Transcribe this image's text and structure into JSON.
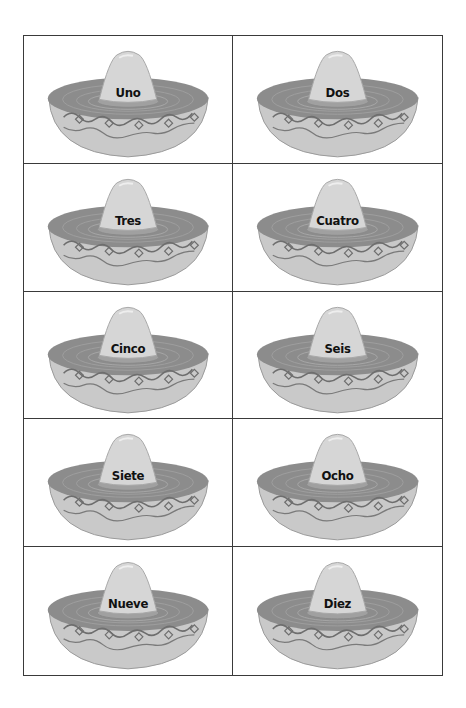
{
  "cards": [
    {
      "label": "Uno"
    },
    {
      "label": "Dos"
    },
    {
      "label": "Tres"
    },
    {
      "label": "Cuatro"
    },
    {
      "label": "Cinco"
    },
    {
      "label": "Seis"
    },
    {
      "label": "Siete"
    },
    {
      "label": "Ocho"
    },
    {
      "label": "Nueve"
    },
    {
      "label": "Diez"
    }
  ],
  "icon": "sombrero-icon",
  "colors": {
    "border": "#3a3a3a",
    "brim_top": "#8c8c8c",
    "brim_side": "#c9c9c9",
    "crown": "#d6d6d6",
    "band": "#a0a0a0",
    "vine": "#6e6e6e"
  }
}
